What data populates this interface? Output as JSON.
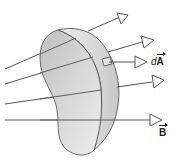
{
  "diagram": {
    "surface": {
      "shape": "curved kidney-shaped surface",
      "face_color": "#d9d9d9",
      "edge_color": "#c4c4c4",
      "outline_color": "#444444"
    },
    "field_lines": [
      {
        "id": "line-1",
        "from": [
          5,
          66
        ],
        "to": [
          128,
          14
        ]
      },
      {
        "id": "line-2",
        "from": [
          5,
          82
        ],
        "to": [
          152,
          40
        ]
      },
      {
        "id": "line-3",
        "from": [
          5,
          103
        ],
        "to": [
          162,
          80
        ]
      },
      {
        "id": "line-4",
        "from": [
          5,
          119
        ],
        "to": [
          161,
          119
        ]
      }
    ],
    "area_element": {
      "label_prefix": "d",
      "label_vector": "A",
      "arrow_to": [
        148,
        62
      ]
    },
    "field_label": {
      "vector": "B"
    },
    "line_color": "#555555"
  }
}
